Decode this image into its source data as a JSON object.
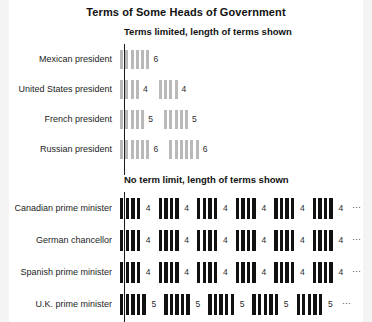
{
  "chart_data": {
    "type": "bar",
    "title": "Terms of Some Heads of Government",
    "xlabel": "",
    "ylabel": "",
    "grid": false,
    "legend": "none",
    "note": "Each thin vertical bar represents one year of a term; groups of bars are consecutive terms. Numeric label after each group is the term length in years.",
    "sections": [
      {
        "id": "limited",
        "heading": "Terms limited, length of terms shown",
        "bar_color": "#b9b9b9",
        "series": [
          {
            "name": "Mexican president",
            "terms": [
              6
            ],
            "truncated": false
          },
          {
            "name": "United States president",
            "terms": [
              4,
              4
            ],
            "truncated": false
          },
          {
            "name": "French president",
            "terms": [
              5,
              5
            ],
            "truncated": false
          },
          {
            "name": "Russian president",
            "terms": [
              6,
              6
            ],
            "truncated": false
          }
        ]
      },
      {
        "id": "unlimited",
        "heading": "No term limit, length of terms shown",
        "bar_color": "#111111",
        "continuation_symbol": "⋯",
        "series": [
          {
            "name": "Canadian prime minister",
            "terms": [
              4,
              4,
              4,
              4,
              4,
              4
            ],
            "truncated": true
          },
          {
            "name": "German chancellor",
            "terms": [
              4,
              4,
              4,
              4,
              4,
              4
            ],
            "truncated": true
          },
          {
            "name": "Spanish prime minister",
            "terms": [
              4,
              4,
              4,
              4,
              4,
              4
            ],
            "truncated": true
          },
          {
            "name": "U.K. prime minister",
            "terms": [
              5,
              5,
              5,
              5,
              5
            ],
            "truncated": true
          }
        ]
      }
    ]
  }
}
